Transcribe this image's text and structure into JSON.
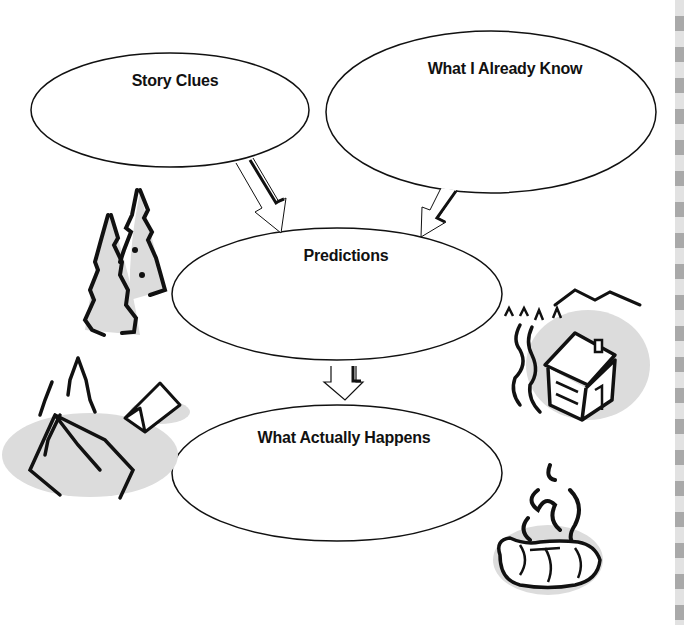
{
  "organizer": {
    "bubbles": [
      {
        "id": "story-clues",
        "label": "Story Clues"
      },
      {
        "id": "what-i-already-know",
        "label": "What I Already Know"
      },
      {
        "id": "predictions",
        "label": "Predictions"
      },
      {
        "id": "what-actually-happens",
        "label": "What Actually Happens"
      }
    ],
    "arrows": [
      {
        "from": "Story Clues",
        "to": "Predictions"
      },
      {
        "from": "What I Already Know",
        "to": "Predictions"
      },
      {
        "from": "Predictions",
        "to": "What Actually Happens"
      }
    ]
  },
  "illustrations": [
    {
      "id": "pine-trees",
      "icon": "pine-trees-icon"
    },
    {
      "id": "campsite-tents",
      "icon": "tent-icon"
    },
    {
      "id": "log-cabin",
      "icon": "cabin-icon"
    },
    {
      "id": "campfire",
      "icon": "campfire-icon"
    }
  ],
  "colors": {
    "ink": "#111111",
    "shadow": "#d9d9d9",
    "stripe_light": "#e2e2e2",
    "stripe_dark": "#a9a9a9"
  }
}
